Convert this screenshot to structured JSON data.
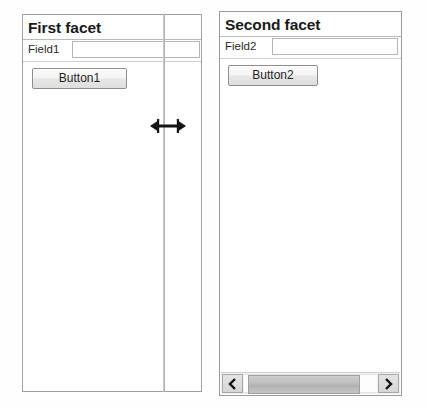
{
  "window": {
    "background_color": "#fefefe",
    "border_color": "#9a9a9a"
  },
  "facets": [
    {
      "id": "left",
      "title": "First facet",
      "field": {
        "label": "Field1",
        "value": "",
        "placeholder": ""
      },
      "button": {
        "label": "Button1"
      },
      "has_scrollbar": false
    },
    {
      "id": "right",
      "title": "Second facet",
      "field": {
        "label": "Field2",
        "value": "",
        "placeholder": ""
      },
      "button": {
        "label": "Button2"
      },
      "has_scrollbar": true,
      "scrollbar": {
        "orientation": "horizontal",
        "left_arrow_icon": "chevron-left-icon",
        "right_arrow_icon": "chevron-right-icon",
        "thumb_position_percent": 4,
        "thumb_width_percent": 80
      }
    }
  ],
  "splitter": {
    "cursor_icon": "horizontal-resize-cursor",
    "color": "#1a1a1a",
    "line_color": "#c6c6c6"
  }
}
